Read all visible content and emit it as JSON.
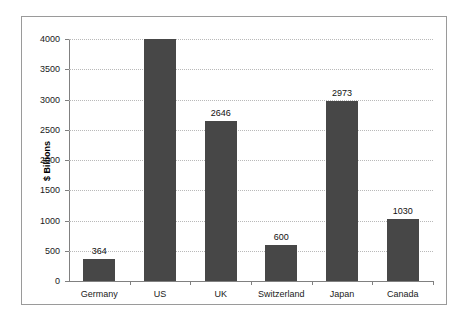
{
  "chart_data": {
    "type": "bar",
    "title": "",
    "subtitle": "",
    "xlabel": "",
    "ylabel": "$ Billions",
    "categories": [
      "Germany",
      "US",
      "UK",
      "Switzerland",
      "Japan",
      "Canada"
    ],
    "values": [
      364,
      4000,
      2646,
      600,
      2973,
      1030
    ],
    "data_labels": [
      "364",
      "",
      "2646",
      "600",
      "2973",
      "1030"
    ],
    "ylim": [
      0,
      4000
    ],
    "ytick_labels": [
      "0",
      "500",
      "1000",
      "1500",
      "2000",
      "2500",
      "3000",
      "3500",
      "4000"
    ],
    "ytick_values": [
      0,
      500,
      1000,
      1500,
      2000,
      2500,
      3000,
      3500,
      4000
    ],
    "grid": true,
    "grid_axis": "y",
    "grid_style": "dotted",
    "legend": false,
    "legend_position": "none",
    "series": [
      {
        "name": "",
        "values": [
          364,
          4000,
          2646,
          600,
          2973,
          1030
        ]
      }
    ]
  },
  "style": {
    "bar_color": "#474747",
    "grid_color": "#b9b9b9",
    "axis_color": "#808080",
    "frame_color": "#9a9a9a",
    "text_color": "#1a1a1a",
    "background": "#ffffff"
  }
}
